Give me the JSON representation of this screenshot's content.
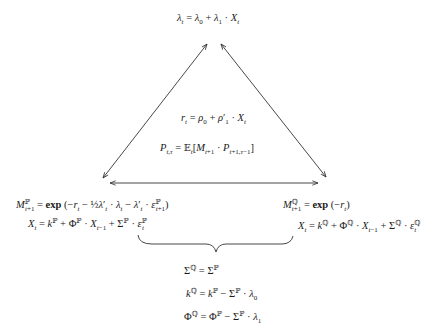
{
  "diagram": {
    "type": "affine-term-structure-triangle",
    "nodes": {
      "top": {
        "label": "market price of risk",
        "equation": "λ_t = λ_0 + λ_1 · X_t"
      },
      "center": {
        "short_rate": "r_t = ρ_0 + ρ_1' · X_t",
        "bond_price": "P_{t,τ} = E_t[M_{t+1} · P_{t+1,τ−1}]"
      },
      "bottom_left": {
        "sdf": "M^P_{t+1} = exp(−r_t − ½λ_t' · λ_t − λ_t' · ε^P_{t+1})",
        "dynamics": "X_t = k^P + Φ^P · X_{t−1} + Σ^P · ε^P_t"
      },
      "bottom_right": {
        "sdf": "M^Q_{t+1} = exp(−r_t)",
        "dynamics": "X_t = k^Q + Φ^Q · X_{t−1} + Σ^Q · ε^Q_t"
      },
      "bottom": {
        "relations": [
          "Σ^Q = Σ^P",
          "k^Q = k^P − Σ^P · λ_0",
          "Φ^Q = Φ^P − Σ^P · λ_1"
        ]
      }
    },
    "edges": [
      {
        "from": "top",
        "to": "bottom_left",
        "style": "double-arrow"
      },
      {
        "from": "top",
        "to": "bottom_right",
        "style": "double-arrow"
      },
      {
        "from": "bottom_left",
        "to": "bottom_right",
        "style": "double-arrow"
      },
      {
        "from": "bottom_left+bottom_right",
        "to": "bottom",
        "style": "underbrace"
      }
    ],
    "colors": {
      "stroke": "#333333",
      "text": "#1a1a1a",
      "background": "#ffffff"
    }
  }
}
